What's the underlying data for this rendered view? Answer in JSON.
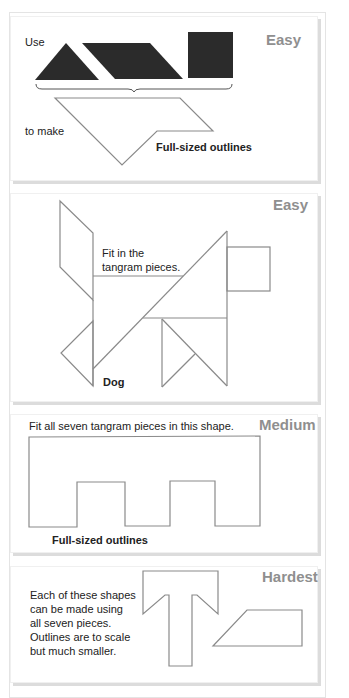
{
  "panels": [
    {
      "level": "Easy",
      "use_label": "Use",
      "make_label": "to make",
      "note": "Full-sized outlines",
      "pieces": [
        "triangle",
        "parallelogram",
        "square"
      ]
    },
    {
      "level": "Easy",
      "instruction": "Fit in the tangram pieces.",
      "instruction_line1": "Fit in the",
      "instruction_line2": "tangram pieces.",
      "shape_label": "Dog"
    },
    {
      "level": "Medium",
      "instruction": "Fit all seven tangram pieces in this shape.",
      "note": "Full-sized outlines"
    },
    {
      "level": "Hardest",
      "description_lines": [
        "Each of these shapes",
        "can be made using",
        "all seven pieces.",
        "Outlines are to scale",
        "but much smaller."
      ]
    }
  ],
  "colors": {
    "piece_fill": "#2b2b2b",
    "outline": "#8a8a8a",
    "level_text": "#8f8f8f"
  }
}
